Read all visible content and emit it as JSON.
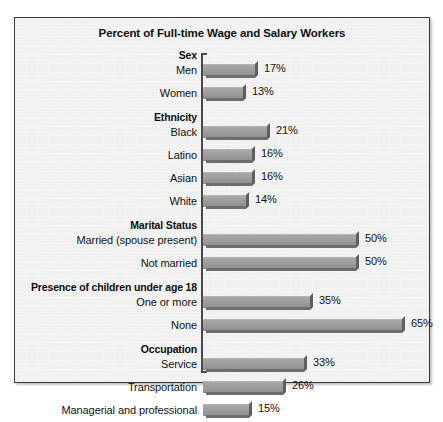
{
  "chart_data": {
    "type": "bar",
    "orientation": "horizontal",
    "title": "Percent of Full-time Wage and Salary Workers",
    "xlabel": "",
    "ylabel": "",
    "xlim": [
      0,
      70
    ],
    "grid": false,
    "legend": null,
    "value_suffix": "%",
    "groups": [
      {
        "name": "Sex",
        "categories": [
          "Men",
          "Women"
        ],
        "values": [
          17,
          13
        ],
        "value_labels": [
          "17%",
          "13%"
        ]
      },
      {
        "name": "Ethnicity",
        "categories": [
          "Black",
          "Latino",
          "Asian",
          "White"
        ],
        "values": [
          21,
          16,
          16,
          14
        ],
        "value_labels": [
          "21%",
          "16%",
          "16%",
          "14%"
        ]
      },
      {
        "name": "Marital Status",
        "categories": [
          "Married (spouse present)",
          "Not married"
        ],
        "values": [
          50,
          50
        ],
        "value_labels": [
          "50%",
          "50%"
        ]
      },
      {
        "name": "Presence of children under age 18",
        "categories": [
          "One or more",
          "None"
        ],
        "values": [
          35,
          65
        ],
        "value_labels": [
          "35%",
          "65%"
        ]
      },
      {
        "name": "Occupation",
        "categories": [
          "Service",
          "Transportation",
          "Managerial and professional"
        ],
        "values": [
          33,
          26,
          15
        ],
        "value_labels": [
          "33%",
          "26%",
          "15%"
        ]
      }
    ],
    "categories": [
      "Men",
      "Women",
      "Black",
      "Latino",
      "Asian",
      "White",
      "Married (spouse present)",
      "Not married",
      "One or more",
      "None",
      "Service",
      "Transportation",
      "Managerial and professional"
    ],
    "values": [
      17,
      13,
      21,
      16,
      16,
      14,
      50,
      50,
      35,
      65,
      33,
      26,
      15
    ]
  },
  "colors": {
    "bar_face": "#9b9b9b",
    "bar_shadow": "#6d6d6d",
    "panel_background": "#f1f1f1",
    "panel_border": "#3a3a3a",
    "text": "#111111"
  }
}
